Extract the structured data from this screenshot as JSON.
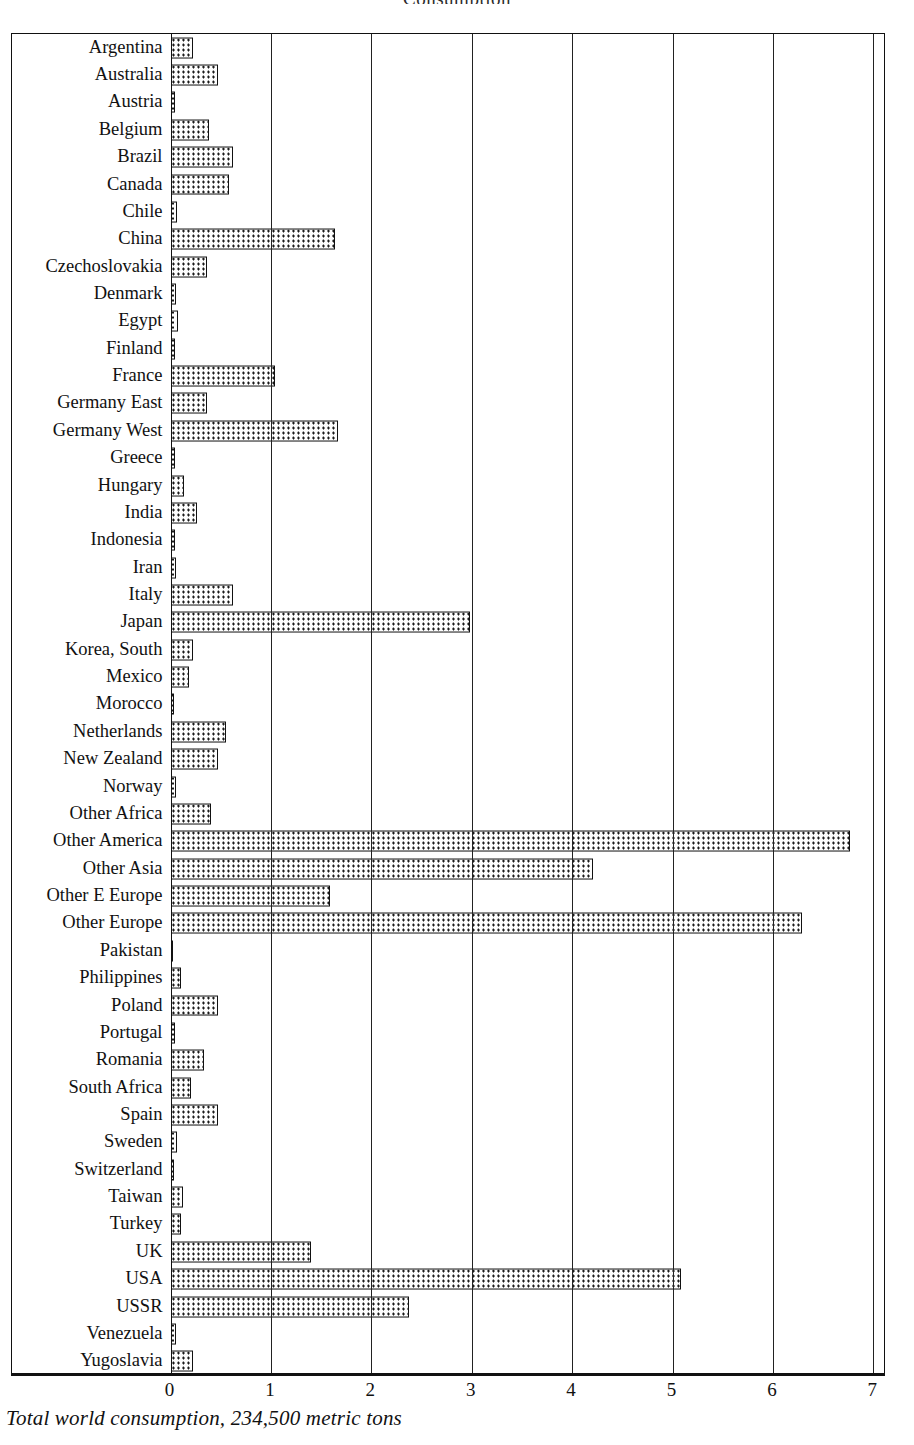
{
  "header": {
    "title": "Consumption",
    "corner_note": ""
  },
  "caption": "Total world consumption, 234,500 metric tons",
  "axis": {
    "ticks": [
      "0",
      "1",
      "2",
      "3",
      "4",
      "5",
      "6",
      "7"
    ],
    "min": 0,
    "max": 7,
    "zero_x_px": 175,
    "px_per_unit": 100.4
  },
  "chart_data": {
    "type": "bar",
    "orientation": "horizontal",
    "title": "Total world consumption, 234,500 metric tons",
    "xlabel": "",
    "ylabel": "",
    "xlim": [
      0,
      7
    ],
    "grid": true,
    "legend": false,
    "units": "percent of total world consumption",
    "total_world_consumption": "234,500 metric tons",
    "categories": [
      "Argentina",
      "Australia",
      "Austria",
      "Belgium",
      "Brazil",
      "Canada",
      "Chile",
      "China",
      "Czechoslovakia",
      "Denmark",
      "Egypt",
      "Finland",
      "France",
      "Germany  East",
      "Germany  West",
      "Greece",
      "Hungary",
      "India",
      "Indonesia",
      "Iran",
      "Italy",
      "Japan",
      "Korea, South",
      "Mexico",
      "Morocco",
      "Netherlands",
      "New Zealand",
      "Norway",
      "Other Africa",
      "Other America",
      "Other Asia",
      "Other E Europe",
      "Other Europe",
      "Pakistan",
      "Philippines",
      "Poland",
      "Portugal",
      "Romania",
      "South Africa",
      "Spain",
      "Sweden",
      "Switzerland",
      "Taiwan",
      "Turkey",
      "UK",
      "USA",
      "USSR",
      "Venezuela",
      "Yugoslavia"
    ],
    "values": [
      0.22,
      0.47,
      0.04,
      0.38,
      0.62,
      0.58,
      0.06,
      1.64,
      0.36,
      0.05,
      0.07,
      0.04,
      1.04,
      0.36,
      1.67,
      0.04,
      0.13,
      0.26,
      0.04,
      0.05,
      0.62,
      2.98,
      0.22,
      0.18,
      0.03,
      0.55,
      0.47,
      0.05,
      0.4,
      6.77,
      4.21,
      1.59,
      6.29,
      0.02,
      0.1,
      0.47,
      0.04,
      0.33,
      0.2,
      0.47,
      0.06,
      0.03,
      0.12,
      0.1,
      1.4,
      5.08,
      2.38,
      0.05,
      0.22
    ]
  }
}
